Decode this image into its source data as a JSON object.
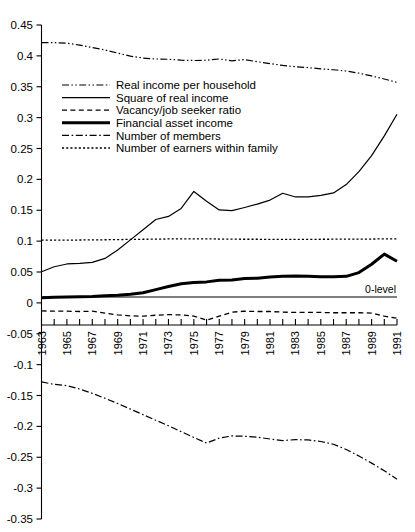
{
  "chart_data": {
    "type": "line",
    "title": "",
    "xlabel": "",
    "ylabel": "",
    "xlim": [
      1963,
      1991
    ],
    "ylim": [
      -0.35,
      0.45
    ],
    "grid": false,
    "y_ticks": [
      0.45,
      0.4,
      0.35,
      0.3,
      0.25,
      0.2,
      0.15,
      0.1,
      0.05,
      0,
      -0.05,
      -0.1,
      -0.15,
      -0.2,
      -0.25,
      -0.3,
      -0.35
    ],
    "y_tick_labels": [
      "0.45",
      "0.4",
      "0.35",
      "0.3",
      "0.25",
      "0.2",
      "0.15",
      "0.1",
      "0.05",
      "0",
      "-0.05",
      "-0.1",
      "-0.15",
      "-0.2",
      "-0.25",
      "-0.3",
      "-0.35"
    ],
    "x_ticks": [
      1963,
      1964,
      1965,
      1966,
      1967,
      1968,
      1969,
      1970,
      1971,
      1972,
      1973,
      1974,
      1975,
      1976,
      1977,
      1978,
      1979,
      1980,
      1981,
      1982,
      1983,
      1984,
      1985,
      1986,
      1987,
      1988,
      1989,
      1990,
      1991
    ],
    "x_tick_labels": [
      "1963",
      "",
      "1965",
      "",
      "1967",
      "",
      "1969",
      "",
      "1971",
      "",
      "1973",
      "",
      "1975",
      "",
      "1977",
      "",
      "1979",
      "",
      "1981",
      "",
      "1983",
      "",
      "1985",
      "",
      "1987",
      "",
      "1989",
      "",
      "1991"
    ],
    "legend_position": "upper-left-inside",
    "annotations": [
      {
        "text": "0-level",
        "x": 1989.3,
        "y": 0.012
      }
    ],
    "reference_lines": [
      {
        "label": "0-level",
        "y": 0,
        "style": "solid"
      }
    ],
    "x": [
      1963,
      1964,
      1965,
      1966,
      1967,
      1968,
      1969,
      1970,
      1971,
      1972,
      1973,
      1974,
      1975,
      1976,
      1977,
      1978,
      1979,
      1980,
      1981,
      1982,
      1983,
      1984,
      1985,
      1986,
      1987,
      1988,
      1989,
      1990,
      1991
    ],
    "series": [
      {
        "name": "Real income per household",
        "style": "dash-dot-dot",
        "width": 1.2,
        "values": [
          0.4215,
          0.4215,
          0.4205,
          0.4175,
          0.4135,
          0.4095,
          0.4045,
          0.3995,
          0.3965,
          0.395,
          0.3945,
          0.393,
          0.3925,
          0.393,
          0.395,
          0.392,
          0.394,
          0.3905,
          0.3875,
          0.3845,
          0.3825,
          0.381,
          0.379,
          0.3775,
          0.3755,
          0.372,
          0.3675,
          0.3625,
          0.357
        ]
      },
      {
        "name": "Square of real income",
        "style": "solid",
        "width": 1.2,
        "values": [
          0.0505,
          0.0585,
          0.063,
          0.064,
          0.0655,
          0.072,
          0.0855,
          0.102,
          0.1185,
          0.135,
          0.14,
          0.153,
          0.1805,
          0.1645,
          0.1505,
          0.1495,
          0.1545,
          0.16,
          0.1665,
          0.1775,
          0.1715,
          0.1715,
          0.174,
          0.178,
          0.1915,
          0.2125,
          0.2385,
          0.2705,
          0.3055
        ]
      },
      {
        "name": "Vacancy/job seeker ratio",
        "style": "dashed",
        "width": 1.3,
        "values": [
          -0.013,
          -0.0135,
          -0.0135,
          -0.014,
          -0.0135,
          -0.0165,
          -0.0195,
          -0.021,
          -0.0215,
          -0.02,
          -0.019,
          -0.0195,
          -0.0215,
          -0.028,
          -0.0215,
          -0.015,
          -0.0135,
          -0.014,
          -0.014,
          -0.015,
          -0.0155,
          -0.0155,
          -0.0155,
          -0.016,
          -0.016,
          -0.016,
          -0.0165,
          -0.0215,
          -0.025
        ]
      },
      {
        "name": "Financial asset income",
        "style": "solid",
        "width": 3.0,
        "values": [
          0.0085,
          0.009,
          0.0095,
          0.01,
          0.0105,
          0.0115,
          0.0125,
          0.014,
          0.0165,
          0.0215,
          0.0265,
          0.031,
          0.033,
          0.034,
          0.0365,
          0.037,
          0.0395,
          0.04,
          0.042,
          0.043,
          0.0435,
          0.043,
          0.0425,
          0.0425,
          0.043,
          0.049,
          0.0625,
          0.079,
          0.0675
        ]
      },
      {
        "name": "Number of members",
        "style": "dash-dot",
        "width": 1.2,
        "values": [
          -0.128,
          -0.132,
          -0.134,
          -0.1395,
          -0.1465,
          -0.1545,
          -0.163,
          -0.172,
          -0.181,
          -0.19,
          -0.199,
          -0.2085,
          -0.218,
          -0.227,
          -0.219,
          -0.2155,
          -0.216,
          -0.2175,
          -0.2205,
          -0.223,
          -0.2215,
          -0.222,
          -0.2245,
          -0.229,
          -0.2375,
          -0.248,
          -0.2595,
          -0.272,
          -0.2855
        ]
      },
      {
        "name": "Number of earners within family",
        "style": "dotted",
        "width": 1.3,
        "values": [
          0.1015,
          0.1015,
          0.1015,
          0.1018,
          0.102,
          0.1022,
          0.1025,
          0.1028,
          0.103,
          0.1032,
          0.1035,
          0.1038,
          0.1038,
          0.1036,
          0.1034,
          0.1032,
          0.103,
          0.103,
          0.1029,
          0.1028,
          0.1028,
          0.1029,
          0.103,
          0.1031,
          0.1032,
          0.1033,
          0.1034,
          0.1036,
          0.1038
        ]
      }
    ],
    "legend": [
      {
        "label": "Real income per household",
        "style": "dash-dot-dot",
        "width": 1.2
      },
      {
        "label": "Square of real income",
        "style": "solid",
        "width": 1.2
      },
      {
        "label": "Vacancy/job seeker ratio",
        "style": "dashed",
        "width": 1.3
      },
      {
        "label": "Financial asset income",
        "style": "solid",
        "width": 3.0
      },
      {
        "label": "Number of members",
        "style": "dash-dot",
        "width": 1.2
      },
      {
        "label": "Number of earners within family",
        "style": "dotted",
        "width": 1.3
      }
    ]
  }
}
